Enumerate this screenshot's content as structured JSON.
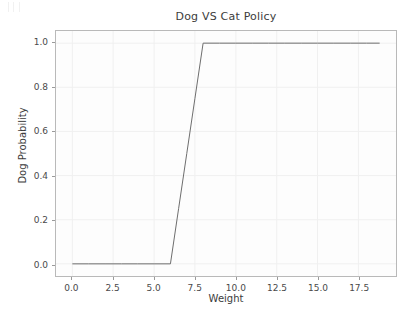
{
  "figure": {
    "width": 418,
    "height": 318,
    "background_color": "#ffffff",
    "plot_background_color": "#fdfdfd",
    "axes_border_color": "#b9b9b9",
    "grid_color": "#f0f0f0",
    "line_color": "#6e6e6e",
    "text_color": "#3c3c3c"
  },
  "chart_data": {
    "type": "line",
    "title": "Dog VS Cat Policy",
    "xlabel": "Weight",
    "ylabel": "Dog Probability",
    "xlim": [
      -1.0,
      19.8
    ],
    "ylim": [
      -0.055,
      1.055
    ],
    "xticks": [
      0.0,
      2.5,
      5.0,
      7.5,
      10.0,
      12.5,
      15.0,
      17.5
    ],
    "xtick_labels": [
      "0.0",
      "2.5",
      "5.0",
      "7.5",
      "10.0",
      "12.5",
      "15.0",
      "17.5"
    ],
    "yticks": [
      0.0,
      0.2,
      0.4,
      0.6,
      0.8,
      1.0
    ],
    "ytick_labels": [
      "0.0",
      "0.2",
      "0.4",
      "0.6",
      "0.8",
      "1.0"
    ],
    "grid": true,
    "legend": false,
    "series": [
      {
        "name": "Dog Probability",
        "color": "#6e6e6e",
        "linewidth": 1,
        "x": [
          0.0,
          1.0,
          2.0,
          3.0,
          4.0,
          5.0,
          6.0,
          6.5,
          7.0,
          7.5,
          8.0,
          9.0,
          10.0,
          11.0,
          12.0,
          13.0,
          14.0,
          15.0,
          16.0,
          17.0,
          18.0,
          18.8
        ],
        "y": [
          0.0,
          0.0,
          0.0,
          0.0,
          0.0,
          0.0,
          0.0,
          0.25,
          0.5,
          0.75,
          1.0,
          1.0,
          1.0,
          1.0,
          1.0,
          1.0,
          1.0,
          1.0,
          1.0,
          1.0,
          1.0,
          1.0
        ]
      }
    ],
    "annotations": [
      "Flat at probability 0.0 for weight 0 to 6",
      "Linear ramp from 0.0 to 1.0 between weight 6 and 8",
      "Flat at probability 1.0 for weight 8 to 18.8"
    ]
  }
}
